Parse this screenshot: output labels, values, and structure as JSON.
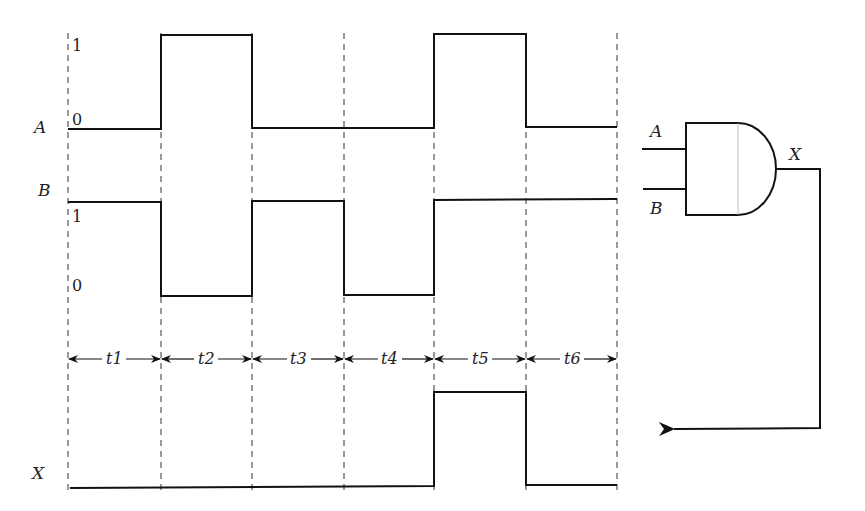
{
  "diagram": {
    "type": "timing-diagram-and-gate",
    "signals": {
      "A": {
        "label": "A",
        "level_high_label": "1",
        "level_low_label": "0",
        "values": [
          0,
          1,
          0,
          0,
          1,
          0
        ]
      },
      "B": {
        "label": "B",
        "level_high_label": "1",
        "level_low_label": "0",
        "values": [
          1,
          0,
          1,
          0,
          1,
          1
        ]
      },
      "X": {
        "label": "X",
        "values": [
          0,
          0,
          0,
          0,
          1,
          0
        ]
      }
    },
    "intervals": [
      "t1",
      "t2",
      "t3",
      "t4",
      "t5",
      "t6"
    ],
    "gate": {
      "type": "AND",
      "input_a": "A",
      "input_b": "B",
      "output": "X"
    }
  }
}
